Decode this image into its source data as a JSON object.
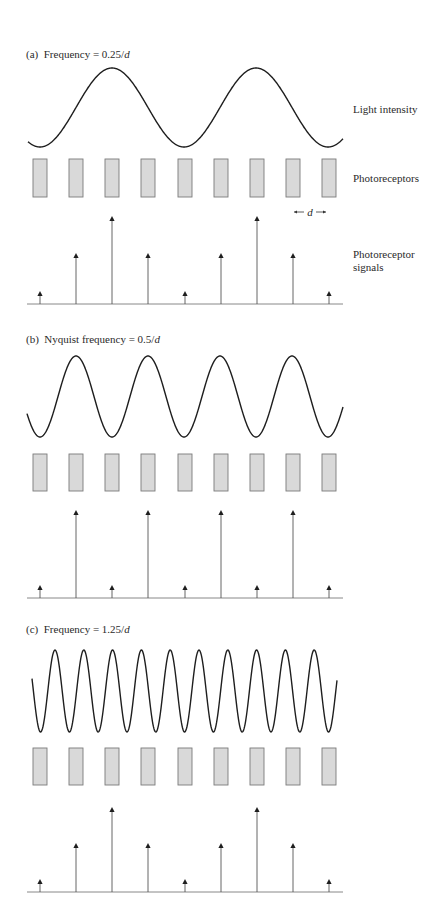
{
  "figure": {
    "spacing_label": "d",
    "side_labels": {
      "light_intensity": "Light intensity",
      "photoreceptors": "Photoreceptors",
      "signals_line1": "Photoreceptor",
      "signals_line2": "signals"
    },
    "colors": {
      "wave": "#1e1e1e",
      "receptor_fill": "#d9d9d9",
      "receptor_stroke": "#7a7a7a",
      "signal": "#555555",
      "arrowhead": "#1e1e1e",
      "baseline": "#888888"
    },
    "receptor_spacing_px": 36,
    "receptor_centers_x": [
      40,
      76,
      112,
      148,
      185,
      221,
      257,
      293,
      329
    ]
  },
  "panels": [
    {
      "id": "a",
      "tag": "(a)",
      "label_prefix": "Frequency = ",
      "label_value": "0.25/",
      "label_var": "d",
      "frequency_per_d": 0.25,
      "title_y": 48,
      "wave": {
        "x_start": 28,
        "x_end": 343,
        "center_y": 107.5,
        "amplitude": 39.5,
        "phase_peak_x": 112,
        "period_px": 144
      },
      "receptors": {
        "top": 159,
        "height": 38,
        "width": 14
      },
      "signals": {
        "baseline_y": 304,
        "heights": [
          13,
          51,
          88,
          51,
          13,
          51,
          88,
          51,
          13
        ]
      },
      "show_spacing_marker": true,
      "side_label_ys": {
        "light_intensity": 103,
        "photoreceptors": 172,
        "signals": 248
      }
    },
    {
      "id": "b",
      "tag": "(b)",
      "label_prefix": "Nyquist frequency = ",
      "label_value": "0.5/",
      "label_var": "d",
      "frequency_per_d": 0.5,
      "title_y": 333,
      "wave": {
        "x_start": 27,
        "x_end": 343,
        "center_y": 396.5,
        "amplitude": 40.5,
        "phase_peak_x": 76,
        "period_px": 72
      },
      "receptors": {
        "top": 454,
        "height": 37,
        "width": 14
      },
      "signals": {
        "baseline_y": 598,
        "heights": [
          13,
          88,
          13,
          88,
          13,
          88,
          13,
          88,
          13
        ]
      },
      "show_spacing_marker": false
    },
    {
      "id": "c",
      "tag": "(c)",
      "label_prefix": "Frequency = ",
      "label_value": "1.25/",
      "label_var": "d",
      "frequency_per_d": 1.25,
      "title_y": 623,
      "wave": {
        "x_start": 32,
        "x_end": 337,
        "center_y": 691,
        "amplitude": 41,
        "phase_peak_x": 55,
        "period_px": 28.8
      },
      "receptors": {
        "top": 748,
        "height": 37,
        "width": 14
      },
      "signals": {
        "baseline_y": 892,
        "heights": [
          13,
          49,
          85,
          49,
          13,
          49,
          85,
          49,
          13
        ]
      },
      "show_spacing_marker": false
    }
  ],
  "chart_data": {
    "type": "diagram",
    "receptor_count": 9,
    "panels": [
      {
        "label": "(a) Frequency = 0.25/d",
        "frequency": 0.25,
        "signal_levels": [
          0.15,
          0.58,
          1.0,
          0.58,
          0.15,
          0.58,
          1.0,
          0.58,
          0.15
        ]
      },
      {
        "label": "(b) Nyquist frequency = 0.5/d",
        "frequency": 0.5,
        "signal_levels": [
          0.15,
          1.0,
          0.15,
          1.0,
          0.15,
          1.0,
          0.15,
          1.0,
          0.15
        ]
      },
      {
        "label": "(c) Frequency = 1.25/d",
        "frequency": 1.25,
        "signal_levels": [
          0.15,
          0.58,
          1.0,
          0.58,
          0.15,
          0.58,
          1.0,
          0.58,
          0.15
        ]
      }
    ],
    "row_labels": [
      "Light intensity",
      "Photoreceptors",
      "Photoreceptor signals"
    ]
  }
}
